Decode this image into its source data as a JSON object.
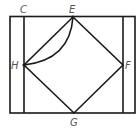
{
  "diagram": {
    "type": "geometry",
    "stroke_color": "#1a1a1a",
    "label_color": "#555555",
    "labels": {
      "C": "C",
      "E": "E",
      "H": "H",
      "F": "F",
      "G": "G"
    },
    "points": {
      "E": [
        73,
        17
      ],
      "H": [
        24,
        65
      ],
      "F": [
        123,
        65
      ],
      "G": [
        74,
        113
      ]
    },
    "shapes": [
      "outer rectangle",
      "two inner vertical lines",
      "square EFGH",
      "arc from E to H"
    ]
  }
}
